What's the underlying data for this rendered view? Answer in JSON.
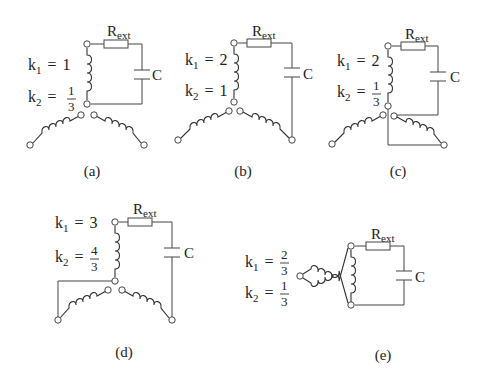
{
  "figure": {
    "panels": [
      {
        "id": "a",
        "label": "(a)",
        "k1": "1",
        "k2_num": "1",
        "k2_den": "3",
        "k2_fraction": true,
        "resistor": "R",
        "resistor_sub": "ext",
        "capacitor": "C"
      },
      {
        "id": "b",
        "label": "(b)",
        "k1": "2",
        "k2": "1",
        "k2_fraction": false,
        "resistor": "R",
        "resistor_sub": "ext",
        "capacitor": "C"
      },
      {
        "id": "c",
        "label": "(c)",
        "k1": "2",
        "k2_num": "1",
        "k2_den": "3",
        "k2_fraction": true,
        "resistor": "R",
        "resistor_sub": "ext",
        "capacitor": "C"
      },
      {
        "id": "d",
        "label": "(d)",
        "k1": "3",
        "k2_num": "4",
        "k2_den": "3",
        "k2_fraction": true,
        "resistor": "R",
        "resistor_sub": "ext",
        "capacitor": "C"
      },
      {
        "id": "e",
        "label": "(e)",
        "k1_num": "2",
        "k1_den": "3",
        "k1_fraction": true,
        "k2_num": "1",
        "k2_den": "3",
        "k2_fraction": true,
        "resistor": "R",
        "resistor_sub": "ext",
        "capacitor": "C"
      }
    ],
    "symbols": {
      "k": "k",
      "sub1": "1",
      "sub2": "2",
      "equals": "="
    }
  }
}
